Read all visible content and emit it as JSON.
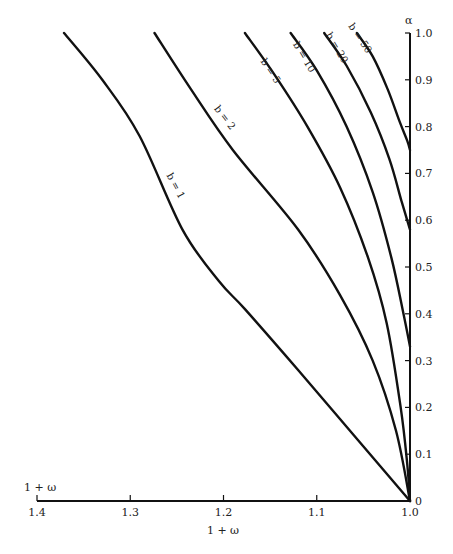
{
  "chart_data": {
    "type": "line",
    "title": "",
    "xlabel": "1 + ω",
    "xlabel_corner": "1 + ω",
    "ylabel": "α",
    "xlim": [
      1.4,
      1.0
    ],
    "ylim": [
      0,
      1.0
    ],
    "x_reversed": true,
    "x_ticks": [
      1.4,
      1.3,
      1.2,
      1.1,
      1.0
    ],
    "x_tick_labels": [
      "1.4",
      "1.3",
      "1.2",
      "1.1",
      "1.0"
    ],
    "y_ticks": [
      0,
      0.1,
      0.2,
      0.3,
      0.4,
      0.5,
      0.6,
      0.7,
      0.8,
      0.9,
      1.0
    ],
    "y_tick_labels": [
      "0",
      "0.1",
      "0.2",
      "0.3",
      "0.4",
      "0.5",
      "0.6",
      "0.7",
      "0.8",
      "0.9",
      "1.0"
    ],
    "grid": false,
    "legend": "inline curve labels",
    "series": [
      {
        "name": "b = 1",
        "points": [
          [
            1.371,
            1.0
          ],
          [
            1.33,
            0.9
          ],
          [
            1.29,
            0.78
          ],
          [
            1.244,
            0.58
          ],
          [
            1.205,
            0.47
          ],
          [
            1.177,
            0.41
          ],
          [
            1.12,
            0.28
          ],
          [
            1.06,
            0.14
          ],
          [
            1.0,
            0.0
          ]
        ],
        "label_at": [
          1.248,
          0.67
        ]
      },
      {
        "name": "b = 2",
        "points": [
          [
            1.274,
            1.0
          ],
          [
            1.235,
            0.88
          ],
          [
            1.19,
            0.75
          ],
          [
            1.12,
            0.58
          ],
          [
            1.075,
            0.44
          ],
          [
            1.04,
            0.3
          ],
          [
            1.015,
            0.15
          ],
          [
            1.0,
            0.0
          ]
        ],
        "label_at": [
          1.195,
          0.815
        ]
      },
      {
        "name": "b = 5",
        "points": [
          [
            1.177,
            1.0
          ],
          [
            1.145,
            0.91
          ],
          [
            1.11,
            0.8
          ],
          [
            1.075,
            0.67
          ],
          [
            1.045,
            0.52
          ],
          [
            1.025,
            0.38
          ],
          [
            1.01,
            0.2
          ],
          [
            1.003,
            0.08
          ],
          [
            1.0,
            0.0
          ]
        ],
        "label_at": [
          1.146,
          0.915
        ]
      },
      {
        "name": "b = 10",
        "points": [
          [
            1.128,
            1.0
          ],
          [
            1.1,
            0.92
          ],
          [
            1.068,
            0.8
          ],
          [
            1.04,
            0.66
          ],
          [
            1.02,
            0.52
          ],
          [
            1.007,
            0.4
          ],
          [
            1.0,
            0.33
          ]
        ],
        "label_at": [
          1.11,
          0.945
        ]
      },
      {
        "name": "b = 20",
        "points": [
          [
            1.092,
            1.0
          ],
          [
            1.068,
            0.93
          ],
          [
            1.042,
            0.83
          ],
          [
            1.022,
            0.73
          ],
          [
            1.009,
            0.64
          ],
          [
            1.0,
            0.58
          ]
        ],
        "label_at": [
          1.075,
          0.965
        ]
      },
      {
        "name": "b = 50",
        "points": [
          [
            1.057,
            1.0
          ],
          [
            1.04,
            0.95
          ],
          [
            1.024,
            0.88
          ],
          [
            1.011,
            0.81
          ],
          [
            1.003,
            0.77
          ],
          [
            1.0,
            0.75
          ]
        ],
        "label_at": [
          1.05,
          0.985
        ]
      }
    ]
  },
  "plot_area": {
    "left": 37,
    "right": 410,
    "top": 33,
    "bottom": 501
  }
}
